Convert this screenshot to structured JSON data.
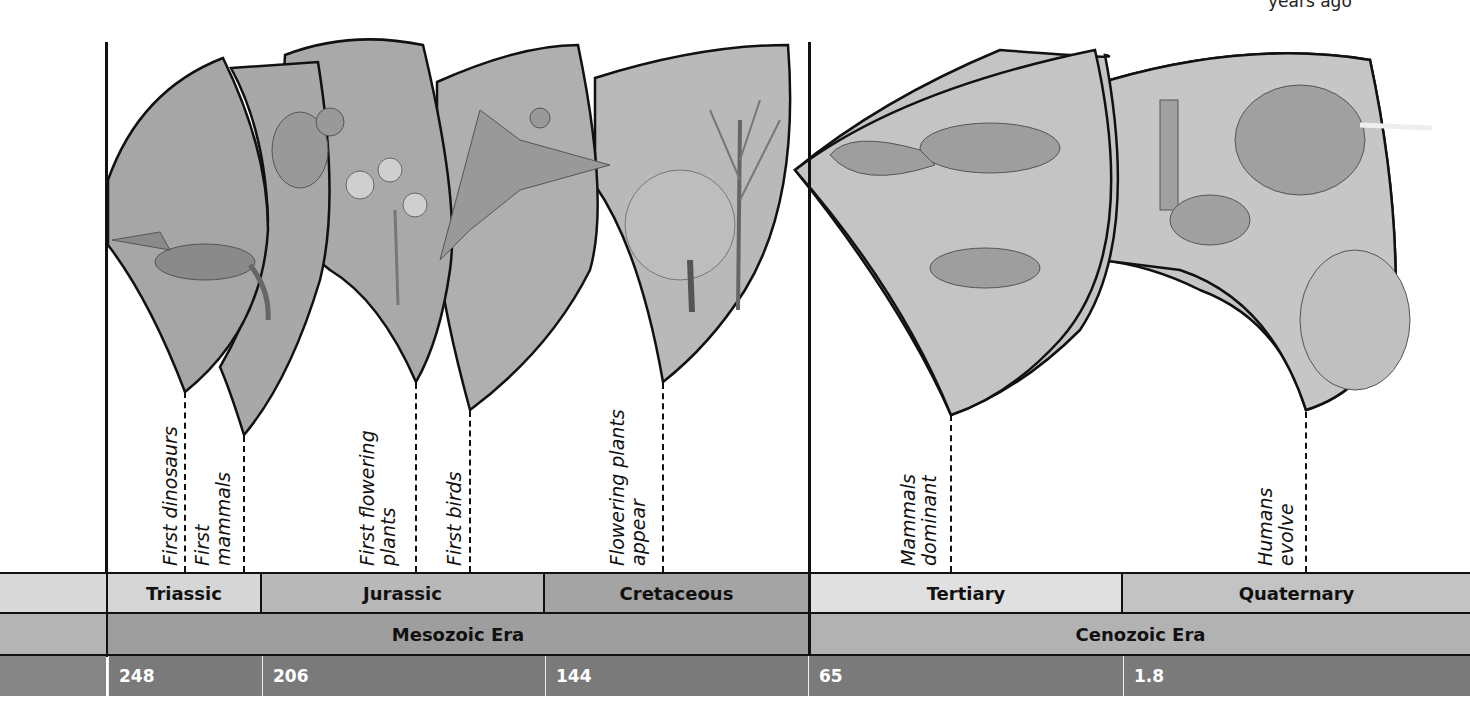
{
  "header": {
    "caption_partial": "years ago"
  },
  "events": [
    {
      "id": "first-dinosaurs",
      "lines": [
        "First dinosaurs"
      ],
      "x": 185
    },
    {
      "id": "first-mammals",
      "lines": [
        "First",
        "mammals"
      ],
      "x": 244
    },
    {
      "id": "first-flowering-plants",
      "lines": [
        "First flowering",
        "plants"
      ],
      "x": 416
    },
    {
      "id": "first-birds",
      "lines": [
        "First birds"
      ],
      "x": 470
    },
    {
      "id": "flowering-plants-appear",
      "lines": [
        "Flowering plants",
        "appear"
      ],
      "x": 663
    },
    {
      "id": "mammals-dominant",
      "lines": [
        "Mammals",
        "dominant"
      ],
      "x": 951
    },
    {
      "id": "humans-evolve",
      "lines": [
        "Humans",
        "evolve"
      ],
      "x": 1306
    }
  ],
  "illustrations": [
    {
      "panel": 1,
      "subject": "early dinosaur"
    },
    {
      "panel": 2,
      "subject": "early mammal (shrew-like)"
    },
    {
      "panel": 3,
      "subject": "flowering plant"
    },
    {
      "panel": 4,
      "subject": "Archaeopteryx (early bird)"
    },
    {
      "panel": 5,
      "subject": "flowering trees"
    },
    {
      "panel": 6,
      "subject": "early mammals"
    },
    {
      "panel": 7,
      "subject": "llama, woolly mammoth, human hunter"
    }
  ],
  "periods": [
    {
      "label": "Triassic",
      "x0": 108,
      "x1": 262
    },
    {
      "label": "Jurassic",
      "x0": 262,
      "x1": 545
    },
    {
      "label": "Cretaceous",
      "x0": 545,
      "x1": 808
    },
    {
      "label": "Tertiary",
      "x0": 808,
      "x1": 1123
    },
    {
      "label": "Quaternary",
      "x0": 1123,
      "x1": 1470
    }
  ],
  "eras": [
    {
      "label": "Mesozoic Era",
      "x0": 108,
      "x1": 808
    },
    {
      "label": "Cenozoic Era",
      "x0": 808,
      "x1": 1470
    }
  ],
  "ages_mya": [
    {
      "label": "248",
      "x0": 108,
      "x1": 262
    },
    {
      "label": "206",
      "x0": 262,
      "x1": 545
    },
    {
      "label": "144",
      "x0": 545,
      "x1": 808
    },
    {
      "label": "65",
      "x0": 808,
      "x1": 1123
    },
    {
      "label": "1.8",
      "x0": 1123,
      "x1": 1470
    }
  ],
  "colors": {
    "panel_fill": "#a9a9a9",
    "panel_fill_light": "#c4c4c4",
    "period_light": "#d6d6d6",
    "period_mid": "#b3b3b3",
    "period_dark": "#a2a2a2",
    "era_band": "#9c9c9c",
    "era_band_light": "#b0b0b0",
    "age_band": "#7a7a7a",
    "outline": "#111111"
  }
}
